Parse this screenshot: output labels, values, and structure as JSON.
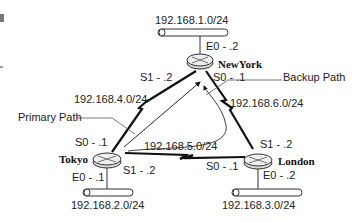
{
  "diagram": {
    "routers": [
      {
        "name": "NewYork",
        "lan": "192.168.1.0/24",
        "e0": "E0 - .2",
        "s0": "S0 - .1",
        "s1": "S1 - .2"
      },
      {
        "name": "Tokyo",
        "lan": "192.168.2.0/24",
        "e0": "E0 - .1",
        "s0": "S0 - .1",
        "s1": "S1 - .2"
      },
      {
        "name": "London",
        "lan": "192.168.3.0/24",
        "e0": "E0 - .2",
        "s0": "S0 - .1",
        "s1": "S1 - .2"
      }
    ],
    "links": {
      "tokyo_newyork": "192.168.4.0/24",
      "tokyo_london": "192.168.5.0/24",
      "newyork_london": "192.168.6.0/24"
    },
    "annotations": {
      "primary_path": "Primary Path",
      "backup_path": "Backup Path"
    },
    "colors": {
      "line": "#111111",
      "router_fill": "#e6e6e6",
      "router_stroke": "#333333"
    }
  }
}
